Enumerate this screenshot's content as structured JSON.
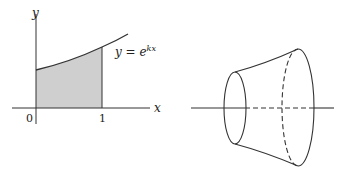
{
  "left_figure": {
    "y_axis_label": "y",
    "x_axis_label": "x",
    "tick_zero": "0",
    "tick_one": "1",
    "curve_label_lhs": "y = e",
    "curve_label_exponent": "kx",
    "fill_color": "#cfcfcf",
    "stroke_color": "#333333"
  },
  "right_figure": {
    "description": "solid of revolution (frustum-like) around horizontal axis",
    "stroke_color": "#333333"
  }
}
